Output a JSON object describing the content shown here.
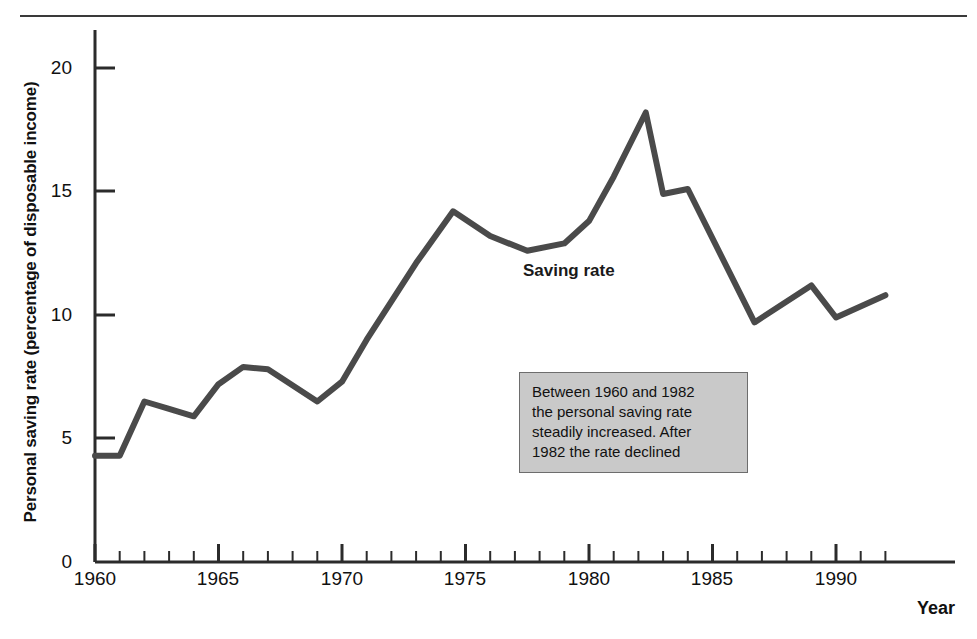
{
  "figure": {
    "title_remnant": "",
    "series_label": "Saving rate",
    "annotation": "Between 1960 and 1982\nthe personal saving rate\nsteadily increased.  After\n1982 the rate declined"
  },
  "axes": {
    "ylabel": "Personal saving rate (percentage of disposable income)",
    "xlabel": "Year",
    "yticks": [
      "0",
      "5",
      "10",
      "15",
      "20"
    ],
    "xticks": [
      "1960",
      "1965",
      "1970",
      "1975",
      "1980",
      "1985",
      "1990"
    ]
  },
  "colors": {
    "line": "#4a4a4a",
    "axis": "#2b2b2b",
    "annotation_fill": "#c9c9c9",
    "annotation_border": "#6d6d6d",
    "text": "#111111"
  },
  "chart_data": {
    "type": "line",
    "title": "Personal saving rate",
    "xlabel": "Year",
    "ylabel": "Personal saving rate (percentage of disposable income)",
    "xlim": [
      1960,
      1992.2
    ],
    "ylim": [
      0,
      21.5
    ],
    "grid": false,
    "legend": "inline-label",
    "x": [
      1960,
      1961,
      1962,
      1963,
      1964,
      1965,
      1966,
      1967,
      1969,
      1970,
      1971,
      1973,
      1974.5,
      1976,
      1977.5,
      1979,
      1980,
      1981,
      1982.3,
      1983,
      1984,
      1986.7,
      1989,
      1990,
      1992
    ],
    "series": [
      {
        "name": "Saving rate",
        "values": [
          4.3,
          4.3,
          6.5,
          6.2,
          5.9,
          7.2,
          7.9,
          7.8,
          6.5,
          7.3,
          9.0,
          12.1,
          14.2,
          13.2,
          12.6,
          12.9,
          13.8,
          15.6,
          18.2,
          14.9,
          15.1,
          9.7,
          11.2,
          9.9,
          10.8
        ]
      }
    ],
    "annotations": [
      {
        "text": "Between 1960 and 1982 the personal saving rate steadily increased.  After 1982 the rate declined",
        "x": 1978.5,
        "y": 5.4
      },
      {
        "text": "Saving rate",
        "x": 1977.2,
        "y": 11.8
      }
    ]
  }
}
